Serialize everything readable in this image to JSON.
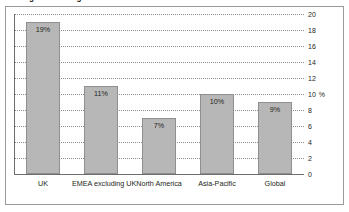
{
  "chart_data": {
    "type": "bar",
    "title": "Average Percentage of Total Workforce",
    "categories": [
      "UK",
      "EMEA excluding UK",
      "North America",
      "Asia-Pacific",
      "Global"
    ],
    "values": [
      19,
      11,
      7,
      10,
      9
    ],
    "value_labels": [
      "19%",
      "11%",
      "7%",
      "10%",
      "9%"
    ],
    "xlabel": "",
    "ylabel": "",
    "y_unit": "%",
    "ylim": [
      0,
      20
    ],
    "y_ticks": [
      20,
      18,
      16,
      14,
      12,
      10,
      8,
      6,
      4,
      2,
      0
    ],
    "y_tick_labels": [
      "20",
      "18",
      "16",
      "14",
      "12",
      "10",
      "8",
      "6",
      "4",
      "2",
      "0"
    ],
    "y_unit_at_tick": "10",
    "grid": true,
    "legend": false,
    "axis_position": "right",
    "bar_color": "#b7b7b7",
    "bar_border_color": "#8f8f8f",
    "grid_color": "#8c8c8c",
    "frame_color": "#9a9a9a",
    "text_color": "#231f20",
    "background": "#ffffff"
  }
}
